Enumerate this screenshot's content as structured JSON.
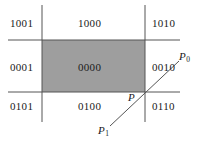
{
  "figure": {
    "colors": {
      "clip_window_fill": "#9e9e9e",
      "line_stroke": "#555555",
      "text": "#1a1a1a",
      "background": "#ffffff"
    },
    "region_codes": [
      {
        "code": "1001",
        "position": "top-left",
        "x": 10,
        "y": 18
      },
      {
        "code": "1000",
        "position": "top-center",
        "x": 78,
        "y": 18
      },
      {
        "code": "1010",
        "position": "top-right",
        "x": 152,
        "y": 18
      },
      {
        "code": "0001",
        "position": "middle-left",
        "x": 10,
        "y": 62
      },
      {
        "code": "0000",
        "position": "middle-center",
        "x": 78,
        "y": 62
      },
      {
        "code": "0010",
        "position": "middle-right",
        "x": 152,
        "y": 62
      },
      {
        "code": "0101",
        "position": "bottom-left",
        "x": 10,
        "y": 101
      },
      {
        "code": "0100",
        "position": "bottom-center",
        "x": 78,
        "y": 101
      },
      {
        "code": "0110",
        "position": "bottom-right",
        "x": 152,
        "y": 101
      }
    ],
    "point_labels": [
      {
        "name": "P",
        "base": "P",
        "subscript": "",
        "x": 128,
        "y": 92
      },
      {
        "name": "P0",
        "base": "P",
        "subscript": "0",
        "x": 179,
        "y": 51
      },
      {
        "name": "P1",
        "base": "P",
        "subscript": "1",
        "x": 98,
        "y": 125
      }
    ],
    "clip_window": {
      "left": 42,
      "top": 40,
      "right": 145,
      "bottom": 92
    },
    "boundary_lines": {
      "vertical_left": {
        "x": 42,
        "y1": 5,
        "y2": 122
      },
      "vertical_right": {
        "x": 145,
        "y1": 5,
        "y2": 122
      },
      "horizontal_top": {
        "y": 40,
        "x1": 8,
        "x2": 180
      },
      "horizontal_bottom": {
        "y": 92,
        "x1": 8,
        "x2": 180
      }
    },
    "segment": {
      "from": {
        "x": 110,
        "y": 126
      },
      "to": {
        "x": 179,
        "y": 61
      }
    }
  }
}
